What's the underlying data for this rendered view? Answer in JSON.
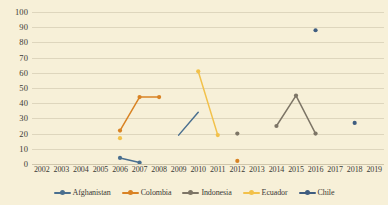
{
  "chart_data": {
    "type": "line",
    "title": "",
    "subtitle": "",
    "xlabel": "",
    "ylabel": "",
    "grid": true,
    "legend_position": "bottom",
    "categories": [
      "2002",
      "2003",
      "2004",
      "2005",
      "2006",
      "2007",
      "2008",
      "2009",
      "2010",
      "2011",
      "2012",
      "2013",
      "2014",
      "2015",
      "2016",
      "2017",
      "2018",
      "2019"
    ],
    "ylim": [
      0,
      100
    ],
    "yticks": [
      0,
      10,
      20,
      30,
      40,
      50,
      60,
      70,
      80,
      90,
      100
    ],
    "ytick_labels": [
      "0",
      "10",
      "20",
      "30",
      "40",
      "50",
      "60",
      "70",
      "80",
      "90",
      "100"
    ],
    "series": [
      {
        "name": "Afghanistan",
        "color": "#4a6f8f",
        "points": [
          {
            "x": "2006",
            "y": 4
          },
          {
            "x": "2007",
            "y": 1
          }
        ],
        "segments": [
          [
            {
              "x": "2006",
              "y": 4
            },
            {
              "x": "2007",
              "y": 1
            }
          ],
          [
            {
              "x": "2009",
              "y": 19
            },
            {
              "x": "2010",
              "y": 34
            }
          ]
        ]
      },
      {
        "name": "Colombia",
        "color": "#d98324",
        "points": [
          {
            "x": "2006",
            "y": 22
          },
          {
            "x": "2007",
            "y": 44
          },
          {
            "x": "2008",
            "y": 44
          },
          {
            "x": "2012",
            "y": 2
          }
        ],
        "segments": [
          [
            {
              "x": "2006",
              "y": 22
            },
            {
              "x": "2007",
              "y": 44
            },
            {
              "x": "2008",
              "y": 44
            }
          ]
        ]
      },
      {
        "name": "Indonesia",
        "color": "#7d7566",
        "points": [
          {
            "x": "2012",
            "y": 20
          },
          {
            "x": "2014",
            "y": 25
          },
          {
            "x": "2015",
            "y": 45
          },
          {
            "x": "2016",
            "y": 20
          }
        ],
        "segments": [
          [
            {
              "x": "2014",
              "y": 25
            },
            {
              "x": "2015",
              "y": 45
            },
            {
              "x": "2016",
              "y": 20
            }
          ]
        ]
      },
      {
        "name": "Ecuador",
        "color": "#f2c14a",
        "points": [
          {
            "x": "2006",
            "y": 17
          },
          {
            "x": "2010",
            "y": 61
          },
          {
            "x": "2011",
            "y": 19
          }
        ],
        "segments": [
          [
            {
              "x": "2010",
              "y": 61
            },
            {
              "x": "2011",
              "y": 19
            }
          ]
        ]
      },
      {
        "name": "Chile",
        "color": "#3f5d80",
        "points": [
          {
            "x": "2016",
            "y": 88
          },
          {
            "x": "2018",
            "y": 27
          }
        ],
        "segments": []
      }
    ]
  }
}
